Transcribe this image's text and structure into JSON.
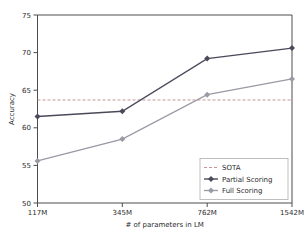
{
  "chart_data": {
    "type": "line",
    "title": "",
    "xlabel": "# of parameters in LM",
    "ylabel": "Accuracy",
    "categories": [
      "117M",
      "345M",
      "762M",
      "1542M"
    ],
    "xlim": [
      0,
      3
    ],
    "ylim": [
      50,
      75
    ],
    "yticks": [
      50,
      55,
      60,
      65,
      70,
      75
    ],
    "ytick_labels": [
      "50",
      "55",
      "60",
      "65",
      "70",
      "75"
    ],
    "xtick_labels": [
      "117M",
      "345M",
      "762M",
      "1542M"
    ],
    "grid": false,
    "legend_position": "lower right",
    "series": [
      {
        "name": "Partial Scoring",
        "color": "#4a4a5a",
        "marker": "diamond",
        "values": [
          61.5,
          62.2,
          69.2,
          70.6
        ]
      },
      {
        "name": "Full Scoring",
        "color": "#9a9aa5",
        "marker": "diamond",
        "values": [
          55.6,
          58.5,
          64.4,
          66.5
        ]
      }
    ],
    "reference_lines": [
      {
        "name": "SOTA",
        "value": 63.7,
        "style": "dashed",
        "color": "#c08a8a"
      }
    ]
  },
  "legend": {
    "entries": [
      {
        "label": "SOTA",
        "style": "dashed",
        "color": "#c08a8a",
        "marker": "none"
      },
      {
        "label": "Partial Scoring",
        "style": "solid",
        "color": "#4a4a5a",
        "marker": "diamond"
      },
      {
        "label": "Full Scoring",
        "style": "solid",
        "color": "#9a9aa5",
        "marker": "diamond"
      }
    ]
  },
  "axes": {
    "y_tick_0": "50",
    "y_tick_1": "55",
    "y_tick_2": "60",
    "y_tick_3": "65",
    "y_tick_4": "70",
    "y_tick_5": "75",
    "x_tick_0": "117M",
    "x_tick_1": "345M",
    "x_tick_2": "762M",
    "x_tick_3": "1542M",
    "xlabel": "# of parameters in LM",
    "ylabel": "Accuracy"
  },
  "colors": {
    "partial": "#4a4a5a",
    "full": "#9a9aa5",
    "sota": "#c08a8a",
    "axis": "#4d4d4d",
    "background": "#ffffff"
  }
}
